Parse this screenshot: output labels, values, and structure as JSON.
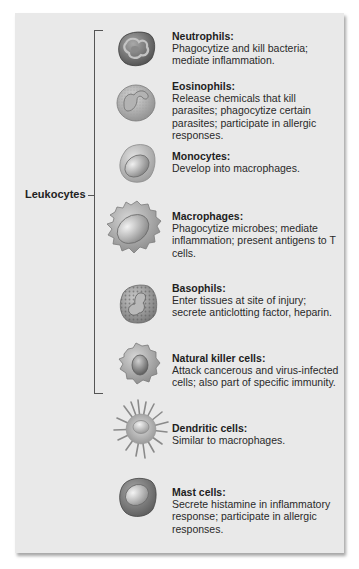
{
  "diagram": {
    "group_label": "Leukocytes",
    "colors": {
      "panel_background": "#e9e9e9",
      "bracket": "#555555",
      "text": "#222222"
    },
    "leukocytes": [
      {
        "name": "Neutrophils:",
        "description": "Phagocytize and kill bacteria; mediate inflammation.",
        "icon": "neutrophil-cell-icon"
      },
      {
        "name": "Eosinophils:",
        "description": "Release chemicals that kill parasites; phagocytize certain parasites; participate in allergic responses.",
        "icon": "eosinophil-cell-icon"
      },
      {
        "name": "Monocytes:",
        "description": "Develop into macrophages.",
        "icon": "monocyte-cell-icon"
      },
      {
        "name": "Macrophages:",
        "description": "Phagocytize microbes; mediate inflammation; present antigens to T cells.",
        "icon": "macrophage-cell-icon"
      },
      {
        "name": "Basophils:",
        "description": "Enter tissues at site of injury; secrete anticlotting factor, heparin.",
        "icon": "basophil-cell-icon"
      },
      {
        "name": "Natural killer cells:",
        "description": "Attack cancerous and virus-infected cells; also part of specific immunity.",
        "icon": "natural-killer-cell-icon"
      }
    ],
    "other_cells": [
      {
        "name": "Dendritic cells:",
        "description": "Similar to macrophages.",
        "icon": "dendritic-cell-icon"
      },
      {
        "name": "Mast cells:",
        "description": "Secrete histamine in inflammatory response; participate in allergic responses.",
        "icon": "mast-cell-icon"
      }
    ]
  }
}
